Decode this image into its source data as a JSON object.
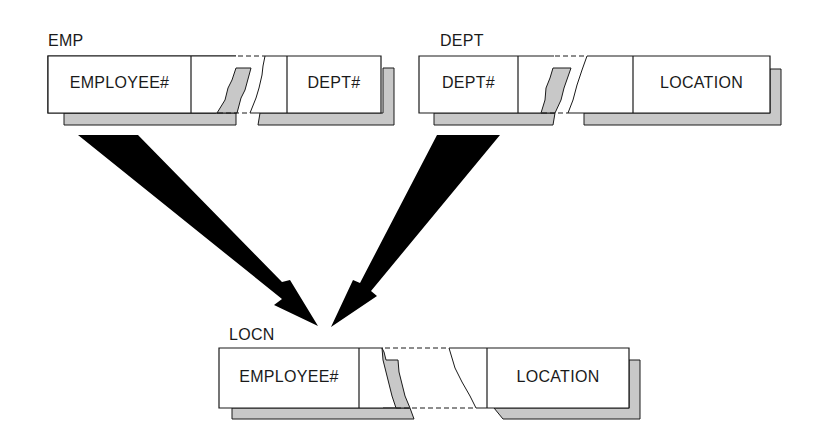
{
  "diagram": {
    "type": "relational-join",
    "colors": {
      "shadow": "#c8c8c8",
      "line": "#1a1a1a",
      "arrow": "#000000",
      "background": "#ffffff"
    },
    "tables": [
      {
        "name": "EMP",
        "columns": [
          "EMPLOYEE#",
          "DEPT#"
        ]
      },
      {
        "name": "DEPT",
        "columns": [
          "DEPT#",
          "LOCATION"
        ]
      },
      {
        "name": "LOCN",
        "columns": [
          "EMPLOYEE#",
          "LOCATION"
        ]
      }
    ],
    "arrows": [
      {
        "from": "EMP",
        "to": "LOCN"
      },
      {
        "from": "DEPT",
        "to": "LOCN"
      }
    ]
  }
}
